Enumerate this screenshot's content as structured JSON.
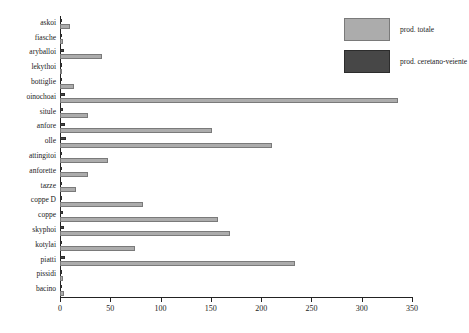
{
  "chart_data": {
    "type": "bar",
    "orientation": "horizontal",
    "title": "",
    "xlabel": "",
    "ylabel": "",
    "xlim": [
      0,
      350
    ],
    "xticks": [
      0,
      50,
      100,
      150,
      200,
      250,
      300,
      350
    ],
    "grid": false,
    "legend_position": "top-right",
    "categories": [
      "askoi",
      "fiasche",
      "aryballoi",
      "lekythoi",
      "bottiglie",
      "oinochoai",
      "situle",
      "anfore",
      "olle",
      "attingitoi",
      "anforette",
      "tazze",
      "coppe D",
      "coppe",
      "skyphoi",
      "kotylai",
      "piatti",
      "pissidi",
      "bacino"
    ],
    "series": [
      {
        "name": "prod. totale",
        "color": "#acacac",
        "values": [
          10,
          3,
          42,
          2,
          14,
          336,
          28,
          151,
          211,
          48,
          28,
          16,
          83,
          157,
          169,
          75,
          234,
          3,
          4
        ]
      },
      {
        "name": "prod. ceretano-veiente",
        "color": "#474747",
        "values": [
          2,
          1,
          4,
          1,
          1,
          5,
          3,
          5,
          6,
          2,
          1,
          1,
          2,
          3,
          4,
          2,
          5,
          1,
          1
        ]
      }
    ]
  },
  "legend": {
    "items": [
      {
        "label": "prod. totale",
        "color": "#acacac"
      },
      {
        "label": "prod. ceretano-veiente",
        "color": "#474747"
      }
    ]
  },
  "colors": {
    "total": "#acacac",
    "ceretano_veiente": "#474747",
    "axis": "#222222",
    "background": "#ffffff"
  }
}
